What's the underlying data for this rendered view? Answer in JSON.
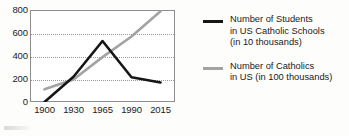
{
  "chart_data": {
    "type": "line",
    "title": "",
    "xlabel": "",
    "ylabel": "",
    "categories": [
      "1900",
      "1930",
      "1965",
      "1990",
      "2015"
    ],
    "ylim": [
      0,
      800
    ],
    "yticks": [
      "0",
      "200",
      "400",
      "600",
      "800"
    ],
    "grid": "horizontal dotted gridlines at 200, 400, 600",
    "legend_position": "right",
    "series": [
      {
        "name": "Number of Students in US Catholic Schools (in 10 thousands)",
        "color": "#161616",
        "values": [
          0,
          220,
          530,
          215,
          170
        ]
      },
      {
        "name": "Number of Catholics in US (in 100 thousands)",
        "color": "#a3a3a3",
        "values": [
          110,
          195,
          390,
          570,
          790
        ]
      }
    ]
  },
  "legend": {
    "entries": [
      {
        "swatch": "black-line-swatch",
        "line1": "Number of Students",
        "line2": "in US Catholic Schools",
        "line3": "(in 10 thousands)"
      },
      {
        "swatch": "gray-line-swatch",
        "line1": "Number of Catholics",
        "line2": "in US (in 100 thousands)",
        "line3": ""
      }
    ]
  }
}
